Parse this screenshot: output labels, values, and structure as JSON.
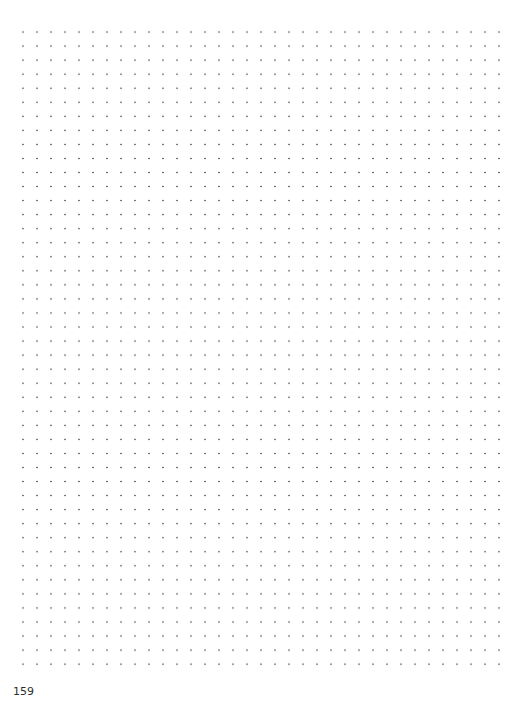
{
  "page": {
    "type": "dot-grid-notebook-page",
    "grid": {
      "columns": 36,
      "rows": 47,
      "dot_color": "#6a6a6a",
      "spacing_px": 14
    },
    "page_number": "159"
  }
}
